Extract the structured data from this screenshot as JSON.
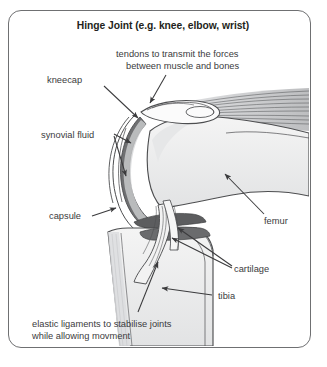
{
  "figure": {
    "title": "Hinge Joint (e.g. knee, elbow, wrist)",
    "border_color": "#6f7072",
    "background_color": "#ffffff",
    "text_color": "#3b3b3d"
  },
  "labels": {
    "tendons_line1": "tendons to transmit the forces",
    "tendons_line2": "between muscle and bones",
    "kneecap": "kneecap",
    "synovial_fluid": "synovial fluid",
    "capsule": "capsule",
    "femur": "femur",
    "cartilage": "cartilage",
    "tibia": "tibia",
    "ligaments_line1": "elastic ligaments to stabilise joints",
    "ligaments_line2": "while allowing movment"
  },
  "anatomy": {
    "femur_name": "femur-bone",
    "tibia_name": "tibia-bone",
    "patella_name": "kneecap-patella",
    "capsule_name": "joint-capsule",
    "cartilage_name": "cartilage-band",
    "tendon_name": "tendon-muscle-fibers",
    "ligament_name": "cruciate-ligaments",
    "synovial_name": "synovial-fluid-space",
    "bone_fill": "#f0f0f0",
    "bone_stroke": "#4d4e50",
    "capsule_fill": "#6e6f71",
    "cartilage_fill": "#5c5d5f",
    "tendon_fill": "#c9cacc",
    "shade_fill": "#d8d9db"
  }
}
